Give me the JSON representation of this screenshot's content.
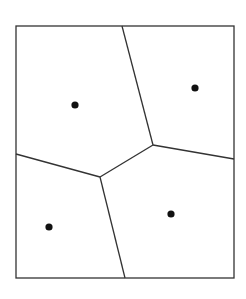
{
  "diagram": {
    "type": "voronoi",
    "width": 246,
    "height": 299,
    "colors": {
      "background": "#ffffff",
      "stroke": "#333333",
      "site": "#111111"
    },
    "bounding_box": {
      "x1": 16,
      "y1": 26,
      "x2": 234,
      "y2": 278
    },
    "vertices": [
      {
        "id": "v1",
        "x": 153,
        "y": 145
      },
      {
        "id": "v2",
        "x": 100,
        "y": 177
      }
    ],
    "edges": [
      {
        "from": [
          122,
          26
        ],
        "to": [
          153,
          145
        ]
      },
      {
        "from": [
          153,
          145
        ],
        "to": [
          234,
          159
        ]
      },
      {
        "from": [
          153,
          145
        ],
        "to": [
          100,
          177
        ]
      },
      {
        "from": [
          16,
          154
        ],
        "to": [
          100,
          177
        ]
      },
      {
        "from": [
          100,
          177
        ],
        "to": [
          125,
          278
        ]
      }
    ],
    "sites": [
      {
        "name": "site-top-left",
        "x": 75,
        "y": 105
      },
      {
        "name": "site-top-right",
        "x": 195,
        "y": 88
      },
      {
        "name": "site-bottom-left",
        "x": 49,
        "y": 227
      },
      {
        "name": "site-bottom-right",
        "x": 171,
        "y": 214
      }
    ]
  }
}
